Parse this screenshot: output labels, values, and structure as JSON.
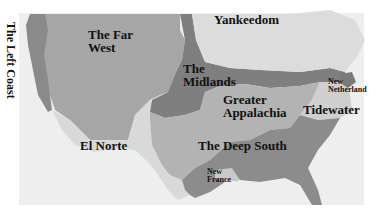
{
  "map": {
    "title": "American Nations",
    "colors": {
      "background": "#ffffff",
      "frame": "#eeeeee",
      "left_coast": "#8a8a8a",
      "far_west": "#a6a6a6",
      "el_norte": "#d9d9d9",
      "midlands": "#7f7f7f",
      "yankeedom": "#dcdcdc",
      "greater_appalachia": "#b3b3b3",
      "tidewater": "#cfcfcf",
      "deep_south": "#8c8c8c",
      "new_france": "#c9c9c9",
      "new_netherland": "#7a7a7a"
    },
    "regions": [
      {
        "id": "left_coast",
        "label": "The Left Coast"
      },
      {
        "id": "far_west",
        "label_lines": [
          "The Far",
          "West"
        ]
      },
      {
        "id": "yankeedom",
        "label": "Yankeedom"
      },
      {
        "id": "midlands",
        "label_lines": [
          "The",
          "Midlands"
        ]
      },
      {
        "id": "new_netherland",
        "label_lines": [
          "New",
          "Netherland"
        ]
      },
      {
        "id": "greater_appalachia",
        "label_lines": [
          "Greater",
          "Appalachia"
        ]
      },
      {
        "id": "tidewater",
        "label": "Tidewater"
      },
      {
        "id": "el_norte",
        "label": "El Norte"
      },
      {
        "id": "deep_south",
        "label": "The Deep South"
      },
      {
        "id": "new_france",
        "label_lines": [
          "New",
          "France"
        ]
      }
    ]
  }
}
